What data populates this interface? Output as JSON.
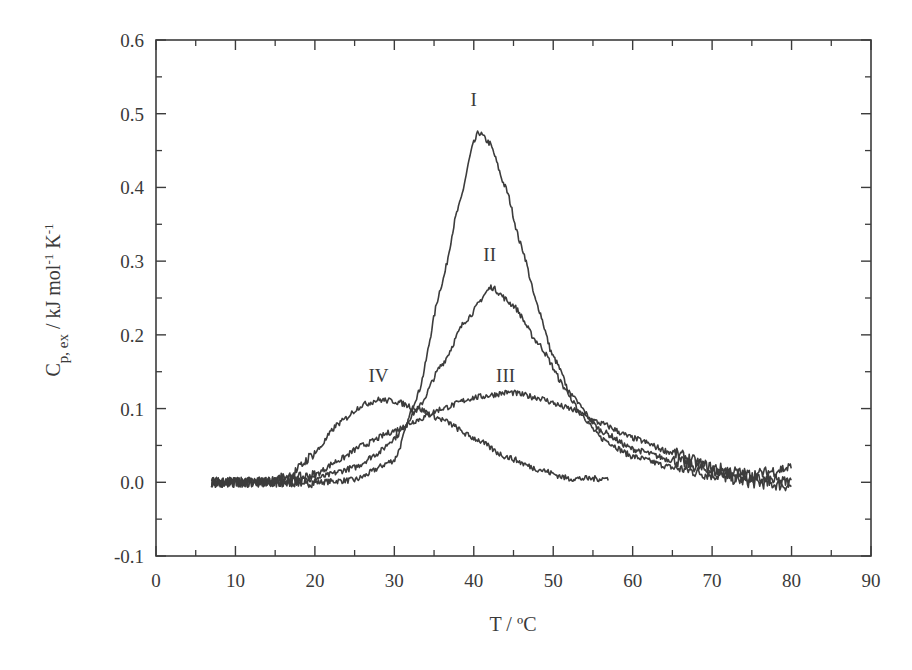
{
  "chart_data": {
    "type": "line",
    "title": "",
    "xlabel": "T / ºC",
    "ylabel_parts": {
      "base": "C",
      "sub": "p, ex",
      "rest": " / kJ mol",
      "sup1": "-1",
      "rest2": " K",
      "sup2": "-1"
    },
    "ylabel": "C_p,ex / kJ mol^-1 K^-1",
    "xlim": [
      0,
      90
    ],
    "ylim": [
      -0.1,
      0.6
    ],
    "xticks": [
      0,
      10,
      20,
      30,
      40,
      50,
      60,
      70,
      80,
      90
    ],
    "xtick_labels": [
      "0",
      "10",
      "20",
      "30",
      "40",
      "50",
      "60",
      "70",
      "80",
      "90"
    ],
    "yticks": [
      -0.1,
      0.0,
      0.1,
      0.2,
      0.3,
      0.4,
      0.5,
      0.6
    ],
    "ytick_labels": [
      "-0.1",
      "0.0",
      "0.1",
      "0.2",
      "0.3",
      "0.4",
      "0.5",
      "0.6"
    ],
    "grid": false,
    "legend": "none (curves labeled inline)",
    "line_color": "#3c3c3c",
    "series": [
      {
        "name": "I",
        "x_range": [
          7,
          80
        ],
        "peak_x": 40.6,
        "peak_y": 0.475,
        "width_left": 5.2,
        "width_right": 7.2,
        "tail": 0.0,
        "x": [
          7,
          15,
          20,
          25,
          30,
          33,
          36,
          38,
          40,
          40.6,
          42,
          44,
          46,
          48,
          50,
          53,
          56,
          60,
          65,
          70,
          75,
          80
        ],
        "y": [
          0.0,
          0.0,
          0.0,
          0.003,
          0.03,
          0.12,
          0.27,
          0.37,
          0.46,
          0.475,
          0.46,
          0.4,
          0.32,
          0.24,
          0.17,
          0.1,
          0.06,
          0.035,
          0.02,
          0.01,
          0.0,
          -0.005
        ],
        "label_pos": [
          40,
          0.52
        ]
      },
      {
        "name": "II",
        "x_range": [
          7,
          80
        ],
        "peak_x": 42.2,
        "peak_y": 0.265,
        "x": [
          7,
          15,
          20,
          25,
          28,
          30,
          33,
          36,
          39,
          42.2,
          45,
          48,
          52,
          56,
          60,
          65,
          70,
          75,
          80
        ],
        "y": [
          0.0,
          0.0,
          0.005,
          0.02,
          0.04,
          0.06,
          0.1,
          0.16,
          0.22,
          0.265,
          0.24,
          0.19,
          0.12,
          0.07,
          0.045,
          0.03,
          0.015,
          0.005,
          0.0
        ],
        "label_pos": [
          42,
          0.31
        ]
      },
      {
        "name": "III",
        "x_range": [
          7,
          80
        ],
        "peak_x": 44.5,
        "peak_y": 0.122,
        "x": [
          7,
          15,
          20,
          23,
          26,
          30,
          33,
          36,
          40,
          44.5,
          48,
          52,
          56,
          60,
          65,
          70,
          75,
          80
        ],
        "y": [
          0.0,
          0.0,
          0.01,
          0.03,
          0.05,
          0.07,
          0.085,
          0.1,
          0.115,
          0.122,
          0.115,
          0.1,
          0.08,
          0.06,
          0.04,
          0.02,
          0.01,
          0.02
        ],
        "label_pos": [
          44,
          0.145
        ]
      },
      {
        "name": "IV",
        "x_range": [
          7,
          57
        ],
        "peak_x": 28,
        "peak_y": 0.112,
        "x": [
          7,
          14,
          17,
          20,
          23,
          26,
          28,
          30,
          33,
          36,
          40,
          44,
          48,
          52,
          57
        ],
        "y": [
          0.0,
          0.0,
          0.01,
          0.04,
          0.08,
          0.105,
          0.112,
          0.11,
          0.1,
          0.085,
          0.06,
          0.035,
          0.018,
          0.005,
          0.005
        ],
        "label_pos": [
          28,
          0.145
        ]
      }
    ]
  }
}
